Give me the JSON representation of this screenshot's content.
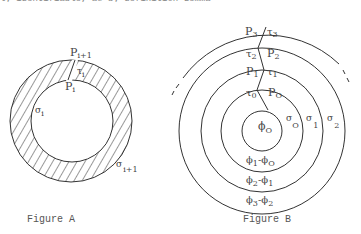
{
  "top_text": "ly identifiable, as by definition Lemma",
  "figure_a": {
    "caption": "Figure A",
    "labels": {
      "p_outer": "P",
      "p_outer_sub": "i+1",
      "tau": "τ",
      "tau_sub": "i",
      "p_inner": "P",
      "p_inner_sub": "i",
      "sigma_inner": "σ",
      "sigma_inner_sub": "i",
      "sigma_outer": "σ",
      "sigma_outer_sub": "i+1"
    }
  },
  "figure_b": {
    "caption": "Figure B",
    "labels": {
      "p3": "P",
      "p3_sub": "3",
      "tau3": "τ",
      "tau3_sub": "3",
      "tau2": "τ",
      "tau2_sub": "2",
      "p2": "P",
      "p2_sub": "2",
      "p1": "P",
      "p1_sub": "1",
      "tau1": "τ",
      "tau1_sub": "1",
      "tau0": "τ",
      "tau0_sub": "0",
      "p0": "P",
      "p0_sub": "O",
      "phi0": "ϕ",
      "phi0_sub": "O",
      "sigma0": "σ",
      "sigma0_sub": "O",
      "sigma1": "σ",
      "sigma1_sub": "1",
      "sigma2": "σ",
      "sigma2_sub": "2",
      "ring1_a": "ϕ",
      "ring1_a_sub": "1",
      "ring1_op": "-",
      "ring1_b": "ϕ",
      "ring1_b_sub": "O",
      "ring2_a": "ϕ",
      "ring2_a_sub": "2",
      "ring2_op": "-",
      "ring2_b": "ϕ",
      "ring2_b_sub": "1",
      "ring3_a": "ϕ",
      "ring3_a_sub": "3",
      "ring3_op": "-",
      "ring3_b": "ϕ",
      "ring3_b_sub": "2"
    }
  },
  "colors": {
    "stroke": "#333333",
    "text": "#444444"
  }
}
